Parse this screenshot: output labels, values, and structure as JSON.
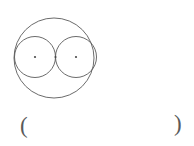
{
  "figure": {
    "stroke_color": "#5a5a5a",
    "dot_color": "#4a4a4a",
    "background_color": "#ffffff",
    "stroke_width": 0.9,
    "big_circle": {
      "label": "outer-circle",
      "cx": 54,
      "cy": 58,
      "r": 40
    },
    "small_circles": [
      {
        "label": "left-inner-circle",
        "cx": 35,
        "cy": 57,
        "r": 20.5
      },
      {
        "label": "right-inner-circle",
        "cx": 76,
        "cy": 57,
        "r": 20.5
      }
    ],
    "dots": [
      {
        "label": "left-center-dot",
        "cx": 35,
        "cy": 57,
        "r": 1.1
      },
      {
        "label": "tangent-point-dot",
        "cx": 55.5,
        "cy": 57,
        "r": 1.1
      },
      {
        "label": "right-center-dot",
        "cx": 76,
        "cy": 57,
        "r": 1.1
      }
    ]
  },
  "annotation": {
    "open_paren": "(",
    "close_paren": ")"
  }
}
